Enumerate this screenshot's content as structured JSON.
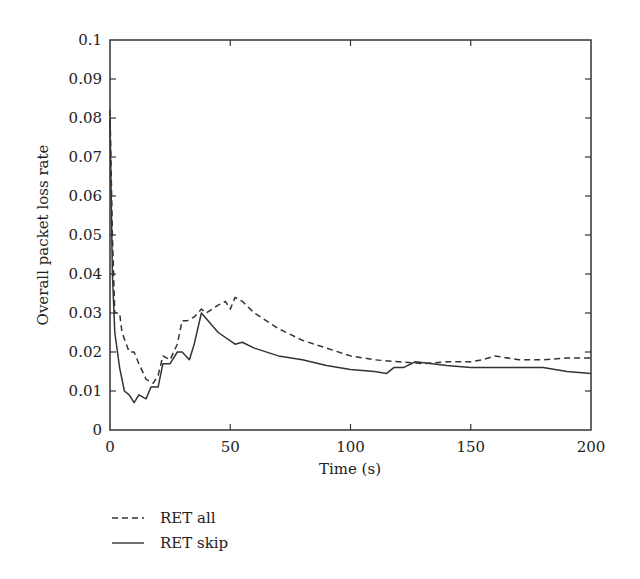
{
  "chart_data": {
    "type": "line",
    "title": "",
    "xlabel": "Time (s)",
    "ylabel": "Overall packet loss rate",
    "xlim": [
      0,
      200
    ],
    "ylim": [
      0,
      0.1
    ],
    "xticks": [
      0,
      50,
      100,
      150,
      200
    ],
    "yticks": [
      0,
      0.01,
      0.02,
      0.03,
      0.04,
      0.05,
      0.06,
      0.07,
      0.08,
      0.09,
      0.1
    ],
    "grid": false,
    "legend_position": "below-left",
    "series": [
      {
        "name": "RET all",
        "style": "dashed",
        "color": "#333333",
        "points": [
          [
            0,
            0.082
          ],
          [
            1,
            0.05
          ],
          [
            2,
            0.03
          ],
          [
            4,
            0.03
          ],
          [
            5,
            0.025
          ],
          [
            8,
            0.02
          ],
          [
            10,
            0.02
          ],
          [
            12,
            0.017
          ],
          [
            15,
            0.013
          ],
          [
            18,
            0.012
          ],
          [
            20,
            0.014
          ],
          [
            22,
            0.019
          ],
          [
            25,
            0.018
          ],
          [
            28,
            0.022
          ],
          [
            30,
            0.028
          ],
          [
            32,
            0.028
          ],
          [
            35,
            0.029
          ],
          [
            38,
            0.031
          ],
          [
            40,
            0.03
          ],
          [
            45,
            0.032
          ],
          [
            48,
            0.033
          ],
          [
            50,
            0.031
          ],
          [
            52,
            0.034
          ],
          [
            55,
            0.033
          ],
          [
            60,
            0.03
          ],
          [
            70,
            0.026
          ],
          [
            80,
            0.023
          ],
          [
            90,
            0.021
          ],
          [
            100,
            0.019
          ],
          [
            110,
            0.018
          ],
          [
            120,
            0.0175
          ],
          [
            130,
            0.017
          ],
          [
            140,
            0.0175
          ],
          [
            150,
            0.0175
          ],
          [
            155,
            0.018
          ],
          [
            160,
            0.019
          ],
          [
            170,
            0.018
          ],
          [
            180,
            0.018
          ],
          [
            190,
            0.0185
          ],
          [
            200,
            0.0185
          ]
        ]
      },
      {
        "name": "RET skip",
        "style": "solid",
        "color": "#333333",
        "points": [
          [
            0,
            0.08
          ],
          [
            1,
            0.04
          ],
          [
            2,
            0.025
          ],
          [
            4,
            0.016
          ],
          [
            6,
            0.01
          ],
          [
            8,
            0.009
          ],
          [
            10,
            0.007
          ],
          [
            12,
            0.009
          ],
          [
            15,
            0.008
          ],
          [
            17,
            0.011
          ],
          [
            20,
            0.011
          ],
          [
            22,
            0.017
          ],
          [
            25,
            0.017
          ],
          [
            28,
            0.02
          ],
          [
            30,
            0.02
          ],
          [
            33,
            0.018
          ],
          [
            35,
            0.022
          ],
          [
            38,
            0.03
          ],
          [
            45,
            0.025
          ],
          [
            52,
            0.022
          ],
          [
            55,
            0.0225
          ],
          [
            60,
            0.021
          ],
          [
            70,
            0.019
          ],
          [
            80,
            0.018
          ],
          [
            90,
            0.0165
          ],
          [
            100,
            0.0155
          ],
          [
            110,
            0.015
          ],
          [
            115,
            0.0145
          ],
          [
            118,
            0.016
          ],
          [
            122,
            0.016
          ],
          [
            127,
            0.0175
          ],
          [
            140,
            0.0165
          ],
          [
            150,
            0.016
          ],
          [
            160,
            0.016
          ],
          [
            170,
            0.016
          ],
          [
            180,
            0.016
          ],
          [
            190,
            0.015
          ],
          [
            200,
            0.0145
          ]
        ]
      }
    ]
  },
  "legend": {
    "items": [
      {
        "label": "RET all",
        "style": "dashed"
      },
      {
        "label": "RET skip",
        "style": "solid"
      }
    ]
  }
}
